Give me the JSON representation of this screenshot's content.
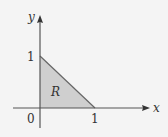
{
  "diagram": {
    "axes": {
      "x_label": "x",
      "y_label": "y"
    },
    "ticks": {
      "origin": "0",
      "x_one": "1",
      "y_one": "1"
    },
    "region": {
      "label": "R",
      "vertices": [
        [
          0,
          0
        ],
        [
          1,
          0
        ],
        [
          0,
          1
        ]
      ],
      "fill": "#cfcfcf"
    },
    "colors": {
      "axis": "#555555",
      "region_edge": "#666666",
      "background": "#f4f4f4"
    }
  }
}
